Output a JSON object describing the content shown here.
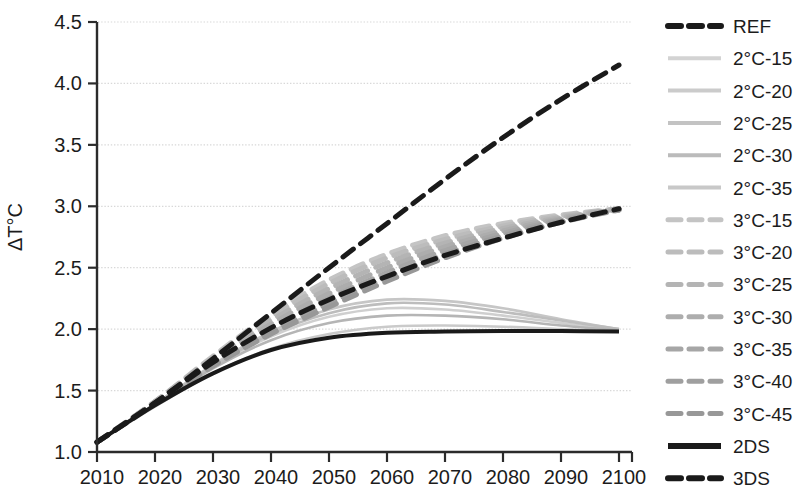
{
  "chart_data": {
    "type": "line",
    "title": "",
    "xlabel": "",
    "ylabel": "ΔT°C",
    "xlim": [
      2010,
      2100
    ],
    "ylim": [
      1.0,
      4.5
    ],
    "xticks": [
      2010,
      2020,
      2030,
      2040,
      2050,
      2060,
      2070,
      2080,
      2090,
      2100
    ],
    "yticks": [
      1.0,
      1.5,
      2.0,
      2.5,
      3.0,
      3.5,
      4.0,
      4.5
    ],
    "ytick_labels": [
      "1.0",
      "1.5",
      "2.0",
      "2.5",
      "3.0",
      "3.5",
      "4.0",
      "4.5"
    ],
    "xtick_labels": [
      "2010",
      "2020",
      "2030",
      "2040",
      "2050",
      "2060",
      "2070",
      "2080",
      "2090",
      "2100"
    ],
    "grid": "horizontal-dotted",
    "legend_position": "right",
    "x": [
      2010,
      2020,
      2030,
      2040,
      2050,
      2060,
      2070,
      2080,
      2090,
      2100
    ],
    "series": [
      {
        "name": "REF",
        "style": "dashed",
        "color": "#1a1a1a",
        "width": 5,
        "values": [
          1.08,
          1.4,
          1.76,
          2.13,
          2.5,
          2.86,
          3.22,
          3.56,
          3.87,
          4.15
        ]
      },
      {
        "name": "2°C-15",
        "style": "solid",
        "color": "#cfcfcf",
        "width": 2.6,
        "values": [
          1.08,
          1.39,
          1.7,
          1.94,
          2.1,
          2.17,
          2.16,
          2.11,
          2.05,
          1.99
        ]
      },
      {
        "name": "2°C-20",
        "style": "solid",
        "color": "#c6c6c6",
        "width": 2.6,
        "values": [
          1.08,
          1.39,
          1.71,
          1.98,
          2.16,
          2.24,
          2.23,
          2.17,
          2.08,
          2.0
        ]
      },
      {
        "name": "2°C-25",
        "style": "solid",
        "color": "#bdbdbd",
        "width": 2.6,
        "values": [
          1.08,
          1.39,
          1.7,
          1.96,
          2.13,
          2.21,
          2.2,
          2.14,
          2.07,
          2.0
        ]
      },
      {
        "name": "2°C-30",
        "style": "solid",
        "color": "#b5b5b5",
        "width": 2.6,
        "values": [
          1.08,
          1.38,
          1.68,
          1.91,
          2.05,
          2.11,
          2.11,
          2.08,
          2.03,
          1.99
        ]
      },
      {
        "name": "2°C-35",
        "style": "solid",
        "color": "#cacaca",
        "width": 2.6,
        "values": [
          1.08,
          1.37,
          1.64,
          1.84,
          1.96,
          2.02,
          2.03,
          2.02,
          2.0,
          1.98
        ]
      },
      {
        "name": "3°C-15",
        "style": "dashed",
        "color": "#c4c4c4",
        "width": 5,
        "values": [
          1.08,
          1.41,
          1.78,
          2.12,
          2.4,
          2.61,
          2.76,
          2.86,
          2.93,
          2.98
        ]
      },
      {
        "name": "3°C-20",
        "style": "dashed",
        "color": "#bcbcbc",
        "width": 5,
        "values": [
          1.08,
          1.41,
          1.77,
          2.1,
          2.37,
          2.58,
          2.73,
          2.84,
          2.92,
          2.98
        ]
      },
      {
        "name": "3°C-25",
        "style": "dashed",
        "color": "#b4b4b4",
        "width": 5,
        "values": [
          1.08,
          1.41,
          1.76,
          2.07,
          2.33,
          2.54,
          2.7,
          2.82,
          2.91,
          2.98
        ]
      },
      {
        "name": "3°C-30",
        "style": "dashed",
        "color": "#adadad",
        "width": 5,
        "values": [
          1.08,
          1.4,
          1.74,
          2.04,
          2.29,
          2.5,
          2.67,
          2.8,
          2.9,
          2.98
        ]
      },
      {
        "name": "3°C-35",
        "style": "dashed",
        "color": "#a6a6a6",
        "width": 5,
        "values": [
          1.08,
          1.4,
          1.73,
          2.01,
          2.25,
          2.46,
          2.64,
          2.78,
          2.89,
          2.97
        ]
      },
      {
        "name": "3°C-40",
        "style": "dashed",
        "color": "#9f9f9f",
        "width": 5,
        "values": [
          1.08,
          1.39,
          1.71,
          1.98,
          2.21,
          2.42,
          2.61,
          2.76,
          2.88,
          2.97
        ]
      },
      {
        "name": "3°C-45",
        "style": "dashed",
        "color": "#989898",
        "width": 5,
        "values": [
          1.08,
          1.39,
          1.7,
          1.96,
          2.18,
          2.39,
          2.58,
          2.74,
          2.87,
          2.97
        ]
      },
      {
        "name": "2DS",
        "style": "solid",
        "color": "#1a1a1a",
        "width": 4,
        "values": [
          1.08,
          1.38,
          1.64,
          1.83,
          1.93,
          1.97,
          1.98,
          1.985,
          1.985,
          1.98
        ]
      },
      {
        "name": "3DS",
        "style": "dashed",
        "color": "#1a1a1a",
        "width": 5,
        "values": [
          1.08,
          1.4,
          1.73,
          2.01,
          2.24,
          2.43,
          2.6,
          2.74,
          2.87,
          2.98
        ]
      }
    ],
    "legend": [
      {
        "label": "REF",
        "style": "dashed",
        "color": "#1a1a1a",
        "width": 6
      },
      {
        "label": "2°C-15",
        "style": "solid",
        "color": "#d3d3d3",
        "width": 4
      },
      {
        "label": "2°C-20",
        "style": "solid",
        "color": "#cbcbcb",
        "width": 4
      },
      {
        "label": "2°C-25",
        "style": "solid",
        "color": "#c3c3c3",
        "width": 4
      },
      {
        "label": "2°C-30",
        "style": "solid",
        "color": "#bbbbbb",
        "width": 4
      },
      {
        "label": "2°C-35",
        "style": "solid",
        "color": "#c8c8c8",
        "width": 4
      },
      {
        "label": "3°C-15",
        "style": "dashed",
        "color": "#c4c4c4",
        "width": 5
      },
      {
        "label": "3°C-20",
        "style": "dashed",
        "color": "#bcbcbc",
        "width": 5
      },
      {
        "label": "3°C-25",
        "style": "dashed",
        "color": "#b4b4b4",
        "width": 5
      },
      {
        "label": "3°C-30",
        "style": "dashed",
        "color": "#adadad",
        "width": 5
      },
      {
        "label": "3°C-35",
        "style": "dashed",
        "color": "#a6a6a6",
        "width": 5
      },
      {
        "label": "3°C-40",
        "style": "dashed",
        "color": "#9f9f9f",
        "width": 5
      },
      {
        "label": "3°C-45",
        "style": "dashed",
        "color": "#989898",
        "width": 5
      },
      {
        "label": "2DS",
        "style": "solid",
        "color": "#1a1a1a",
        "width": 6
      },
      {
        "label": "3DS",
        "style": "dashed",
        "color": "#1a1a1a",
        "width": 6
      }
    ]
  },
  "colors": {
    "axis": "#2b2b2b",
    "grid": "#d8d8d8",
    "text": "#1c1c1c",
    "background": "#ffffff"
  }
}
